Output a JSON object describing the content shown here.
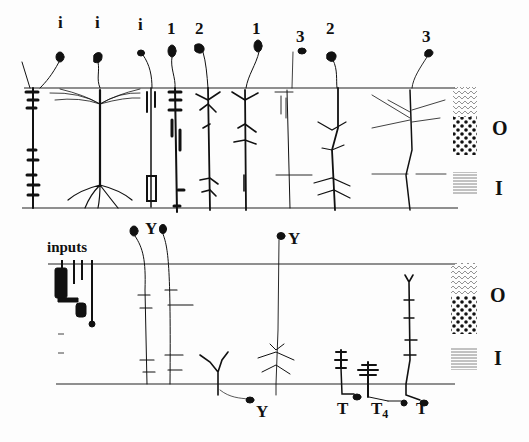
{
  "figure": {
    "top_panel": {
      "cell_labels": [
        {
          "text": "i",
          "x": 58,
          "y": 28
        },
        {
          "text": "i",
          "x": 95,
          "y": 28
        },
        {
          "text": "i",
          "x": 138,
          "y": 30
        },
        {
          "text": "1",
          "x": 167,
          "y": 23
        },
        {
          "text": "2",
          "x": 195,
          "y": 23
        },
        {
          "text": "1",
          "x": 252,
          "y": 23
        },
        {
          "text": "3",
          "x": 296,
          "y": 30
        },
        {
          "text": "2",
          "x": 326,
          "y": 23
        },
        {
          "text": "3",
          "x": 422,
          "y": 30
        }
      ],
      "layer_labels": {
        "outer": "O",
        "inner": "I"
      }
    },
    "bottom_panel": {
      "inputs_label": "inputs",
      "cell_labels": [
        {
          "text": "Y",
          "x": 146,
          "y": 222
        },
        {
          "text": "Y",
          "x": 290,
          "y": 232
        },
        {
          "text": "Y",
          "x": 256,
          "y": 404
        },
        {
          "text": "T",
          "x": 338,
          "y": 400
        },
        {
          "text": "T",
          "sub": "4",
          "x": 372,
          "y": 400
        },
        {
          "text": "T",
          "x": 418,
          "y": 400
        }
      ],
      "layer_labels": {
        "outer": "O",
        "inner": "I"
      }
    }
  }
}
